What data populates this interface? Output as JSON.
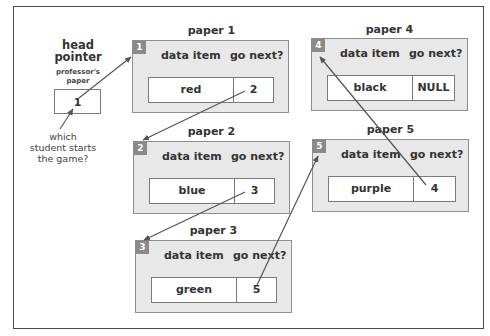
{
  "diagram": {
    "head_pointer": {
      "title_line1": "head",
      "title_line2": "pointer",
      "subtitle_line1": "professor's",
      "subtitle_line2": "paper",
      "value": "1",
      "question_line1": "which",
      "question_line2": "student starts",
      "question_line3": "the game?"
    },
    "column_headers": {
      "data": "data item",
      "next": "go next?"
    },
    "papers": [
      {
        "id": "1",
        "title": "paper 1",
        "data": "red",
        "next": "2"
      },
      {
        "id": "2",
        "title": "paper 2",
        "data": "blue",
        "next": "3"
      },
      {
        "id": "3",
        "title": "paper 3",
        "data": "green",
        "next": "5"
      },
      {
        "id": "4",
        "title": "paper 4",
        "data": "black",
        "next": "NULL"
      },
      {
        "id": "5",
        "title": "paper 5",
        "data": "purple",
        "next": "4"
      }
    ],
    "links": [
      {
        "from": "head",
        "to": "1"
      },
      {
        "from": "1",
        "to": "2"
      },
      {
        "from": "2",
        "to": "3"
      },
      {
        "from": "3",
        "to": "5"
      },
      {
        "from": "5",
        "to": "4"
      }
    ],
    "colors": {
      "paper_fill": "#e8e8e8",
      "badge_fill": "#8a8a8a",
      "border": "#7a7a7a",
      "arrow": "#555555"
    }
  }
}
